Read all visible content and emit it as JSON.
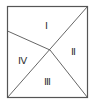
{
  "diagram": {
    "type": "partitioned-rectangle",
    "stroke_color": "#555555",
    "regions": [
      {
        "id": "I",
        "label": "Ⅰ"
      },
      {
        "id": "II",
        "label": "Ⅱ"
      },
      {
        "id": "III",
        "label": "Ⅲ"
      },
      {
        "id": "IV",
        "label": "Ⅳ"
      }
    ]
  }
}
